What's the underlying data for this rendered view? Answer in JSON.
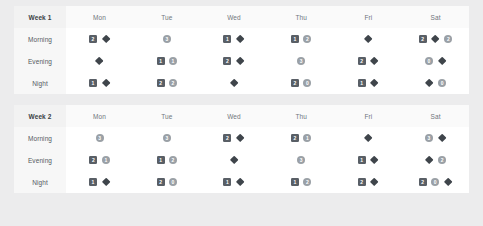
{
  "weeks": [
    {
      "label": "Week 1",
      "days": [
        "Mon",
        "Tue",
        "Wed",
        "Thu",
        "Fri",
        "Sat"
      ],
      "rows": [
        {
          "label": "Morning",
          "cells": [
            [
              {
                "shape": "square",
                "value": "2"
              },
              {
                "shape": "diamond",
                "value": ""
              }
            ],
            [
              {
                "shape": "circle",
                "value": "3"
              }
            ],
            [
              {
                "shape": "square",
                "value": "1"
              },
              {
                "shape": "diamond",
                "value": ""
              }
            ],
            [
              {
                "shape": "square",
                "value": "1"
              },
              {
                "shape": "circle",
                "value": "2"
              }
            ],
            [
              {
                "shape": "diamond",
                "value": ""
              }
            ],
            [
              {
                "shape": "square",
                "value": "2"
              },
              {
                "shape": "diamond",
                "value": ""
              },
              {
                "shape": "circle",
                "value": "2"
              }
            ]
          ]
        },
        {
          "label": "Evening",
          "cells": [
            [
              {
                "shape": "diamond",
                "value": ""
              }
            ],
            [
              {
                "shape": "square",
                "value": "1"
              },
              {
                "shape": "circle",
                "value": "1"
              }
            ],
            [
              {
                "shape": "square",
                "value": "2"
              },
              {
                "shape": "diamond",
                "value": ""
              }
            ],
            [
              {
                "shape": "circle",
                "value": "3"
              }
            ],
            [
              {
                "shape": "square",
                "value": "2"
              },
              {
                "shape": "diamond",
                "value": ""
              }
            ],
            [
              {
                "shape": "circle",
                "value": "0"
              },
              {
                "shape": "diamond",
                "value": ""
              }
            ]
          ]
        },
        {
          "label": "Night",
          "cells": [
            [
              {
                "shape": "square",
                "value": "1"
              },
              {
                "shape": "diamond",
                "value": ""
              }
            ],
            [
              {
                "shape": "square",
                "value": "2"
              },
              {
                "shape": "circle",
                "value": "2"
              }
            ],
            [
              {
                "shape": "diamond",
                "value": ""
              }
            ],
            [
              {
                "shape": "square",
                "value": "2"
              },
              {
                "shape": "circle",
                "value": "0"
              }
            ],
            [
              {
                "shape": "square",
                "value": "1"
              },
              {
                "shape": "diamond",
                "value": ""
              }
            ],
            [
              {
                "shape": "diamond",
                "value": ""
              },
              {
                "shape": "circle",
                "value": "0"
              }
            ]
          ]
        }
      ]
    },
    {
      "label": "Week 2",
      "days": [
        "Mon",
        "Tue",
        "Wed",
        "Thu",
        "Fri",
        "Sat"
      ],
      "rows": [
        {
          "label": "Morning",
          "cells": [
            [
              {
                "shape": "circle",
                "value": "3"
              }
            ],
            [
              {
                "shape": "circle",
                "value": "3"
              }
            ],
            [
              {
                "shape": "square",
                "value": "2"
              },
              {
                "shape": "diamond",
                "value": ""
              }
            ],
            [
              {
                "shape": "square",
                "value": "2"
              },
              {
                "shape": "circle",
                "value": "1"
              }
            ],
            [
              {
                "shape": "diamond",
                "value": ""
              }
            ],
            [
              {
                "shape": "circle",
                "value": "3"
              },
              {
                "shape": "diamond",
                "value": ""
              }
            ]
          ]
        },
        {
          "label": "Evening",
          "cells": [
            [
              {
                "shape": "square",
                "value": "2"
              },
              {
                "shape": "circle",
                "value": "1"
              }
            ],
            [
              {
                "shape": "square",
                "value": "1"
              },
              {
                "shape": "circle",
                "value": "2"
              }
            ],
            [
              {
                "shape": "diamond",
                "value": ""
              }
            ],
            [
              {
                "shape": "circle",
                "value": "3"
              }
            ],
            [
              {
                "shape": "square",
                "value": "1"
              },
              {
                "shape": "diamond",
                "value": ""
              }
            ],
            [
              {
                "shape": "diamond",
                "value": ""
              },
              {
                "shape": "circle",
                "value": "2"
              }
            ]
          ]
        },
        {
          "label": "Night",
          "cells": [
            [
              {
                "shape": "square",
                "value": "1"
              },
              {
                "shape": "diamond",
                "value": ""
              }
            ],
            [
              {
                "shape": "square",
                "value": "2"
              },
              {
                "shape": "circle",
                "value": "0"
              }
            ],
            [
              {
                "shape": "square",
                "value": "1"
              },
              {
                "shape": "diamond",
                "value": ""
              }
            ],
            [
              {
                "shape": "square",
                "value": "1"
              },
              {
                "shape": "circle",
                "value": "2"
              }
            ],
            [
              {
                "shape": "square",
                "value": "2"
              },
              {
                "shape": "diamond",
                "value": ""
              }
            ],
            [
              {
                "shape": "square",
                "value": "2"
              },
              {
                "shape": "circle",
                "value": "0"
              },
              {
                "shape": "diamond",
                "value": ""
              }
            ]
          ]
        }
      ]
    }
  ],
  "colors": {
    "page_background": "#ececed",
    "panel_background": "#ffffff",
    "square_badge": "#595f66",
    "circle_badge": "#9aa0a6",
    "diamond_badge": "#3f454b",
    "header_background": "#fafafa",
    "label_background": "#f7f7f7"
  }
}
